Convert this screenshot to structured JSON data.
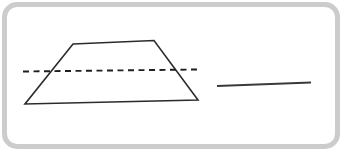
{
  "canvas": {
    "width": 344,
    "height": 155,
    "background": "#ffffff"
  },
  "card": {
    "border_color": "#cccccc",
    "border_width_px": 5,
    "corner_radius_px": 15,
    "fill": "#ffffff"
  },
  "figure": {
    "trapezoid": {
      "points": "73,44 154,40.5 198,100 25,104",
      "stroke": "#2b2b2b",
      "stroke_width": "1.6",
      "fill": "none"
    },
    "dashed_line": {
      "x1": "23",
      "y1": "71.5",
      "x2": "197",
      "y2": "69.5",
      "stroke": "#1f1f1f",
      "stroke_width": "1.9",
      "dasharray": "6 4.5"
    },
    "answer_line": {
      "x1": "217",
      "y1": "86",
      "x2": "311",
      "y2": "82.5",
      "stroke": "#3a3a3a",
      "stroke_width": "2.2"
    }
  }
}
